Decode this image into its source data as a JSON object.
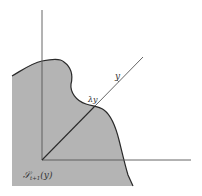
{
  "figure": {
    "type": "geometric-diagram",
    "colors": {
      "background": "#ffffff",
      "region_fill": "#b4b4b4",
      "curve_stroke": "#2a2a2a",
      "axis_stroke": "#555555"
    },
    "labels": {
      "ray_point": "y",
      "scaled_point": "λy",
      "region_name": "𝒮",
      "region_subscript": "t+1",
      "region_arg": "(y)"
    }
  }
}
